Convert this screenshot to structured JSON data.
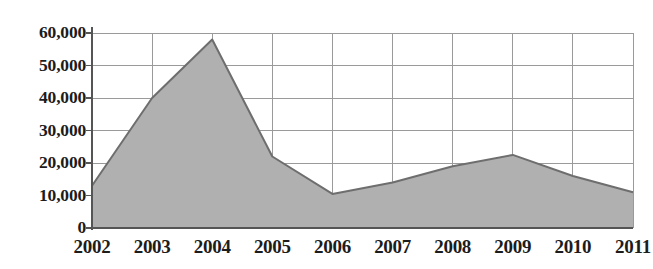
{
  "chart_data": {
    "type": "area",
    "title": "",
    "subtitle": "",
    "xlabel": "",
    "ylabel": "",
    "categories": [
      "2002",
      "2003",
      "2004",
      "2005",
      "2006",
      "2007",
      "2008",
      "2009",
      "2010",
      "2011"
    ],
    "values": [
      13000,
      40000,
      58000,
      22000,
      10500,
      14000,
      19000,
      22500,
      16000,
      11000
    ],
    "series": [
      {
        "name": "",
        "values": [
          13000,
          40000,
          58000,
          22000,
          10500,
          14000,
          19000,
          22500,
          16000,
          11000
        ]
      }
    ],
    "ylim": [
      0,
      60000
    ],
    "yticks": [
      0,
      10000,
      20000,
      30000,
      40000,
      50000,
      60000
    ],
    "ytick_labels": [
      "0",
      "10,000",
      "20,000",
      "30,000",
      "40,000",
      "50,000",
      "60,000"
    ],
    "xtick_labels": [
      "2002",
      "2003",
      "2004",
      "2005",
      "2006",
      "2007",
      "2008",
      "2009",
      "2010",
      "2011"
    ],
    "grid": true,
    "grid_x": true,
    "grid_y": true,
    "legend": false,
    "legend_position": "none",
    "annotations": [],
    "colors": {
      "area_fill": "#b0b0b0",
      "area_line": "#6e6e6e",
      "grid": "#9a9a9a",
      "axis": "#555555",
      "text": "#1c1c1c",
      "background": "#ffffff"
    }
  }
}
